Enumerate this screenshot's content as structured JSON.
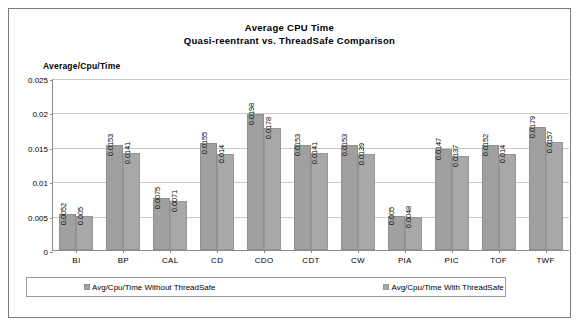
{
  "chart_data": {
    "type": "bar",
    "title": "Average CPU Time",
    "subtitle": "Quasi-reentrant  vs. ThreadSafe Comparison",
    "ylabel": "Average/Cpu/Time",
    "xlabel": "",
    "ylim": [
      0,
      0.025
    ],
    "yticks": [
      "0",
      "0.005",
      "0.01",
      "0.015",
      "0.02",
      "0.025"
    ],
    "ytick_values": [
      0,
      0.005,
      0.01,
      0.015,
      0.02,
      0.025
    ],
    "grid": true,
    "legend_position": "bottom",
    "categories": [
      "BI",
      "BP",
      "CAL",
      "CD",
      "CDO",
      "CDT",
      "CW",
      "PIA",
      "PIC",
      "TOF",
      "TWF"
    ],
    "series": [
      {
        "name": "Avg/Cpu/Time Without ThreadSafe",
        "color": "#a0a0a0",
        "values": [
          0.0052,
          0.0153,
          0.0075,
          0.0155,
          0.0198,
          0.0153,
          0.0153,
          0.005,
          0.0147,
          0.0152,
          0.0179
        ],
        "labels": [
          "0.0052",
          "0.0153",
          "0.0075",
          "0.0155",
          "0.0198",
          "0.0153",
          "0.0153",
          "0.005",
          "0.0147",
          "0.0152",
          "0.0179"
        ]
      },
      {
        "name": "Avg/Cpu/Time With ThreadSafe",
        "color": "#a8a8a8",
        "values": [
          0.005,
          0.0141,
          0.0071,
          0.014,
          0.0178,
          0.0141,
          0.0139,
          0.0048,
          0.0137,
          0.014,
          0.0157
        ],
        "labels": [
          "0.005",
          "0.0141",
          "0.0071",
          "0.014",
          "0.0178",
          "0.0141",
          "0.0139",
          "0.0048",
          "0.0137",
          "0.014",
          "0.0157"
        ]
      }
    ]
  }
}
